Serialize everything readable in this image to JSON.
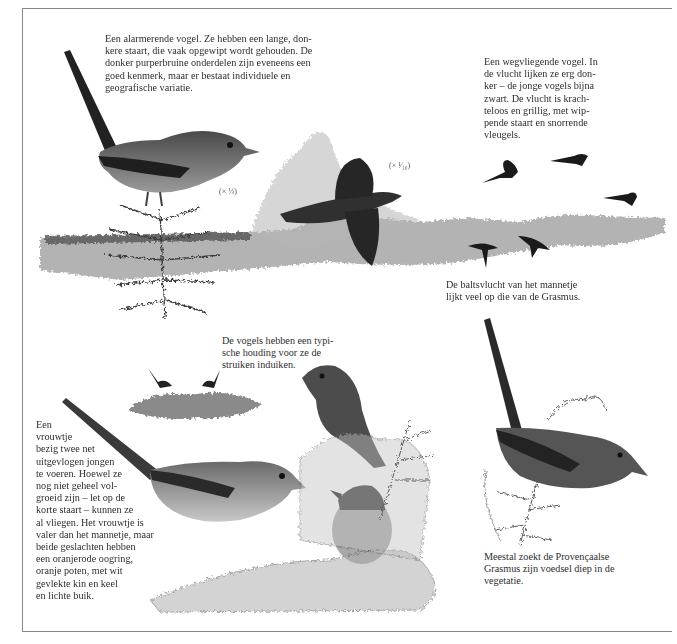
{
  "captions": {
    "alarm": "Een alarmerende vogel. Ze hebben een lange, don-\nkere staart, die vaak opgewipt wordt gehouden. De\ndonker purperbruine onderdelen zijn eveneens een\ngoed kenmerk, maar er bestaat individuele en\ngeografische variatie.",
    "flying": "Een wegvliegende vogel. In\nde vlucht lijken ze erg don-\nker – de jonge vogels bijna\nzwart. De vlucht is krach-\nteloos en grillig, met wip-\npende staart en snorrende\nvleugels.",
    "display_flight": "De baltsvlucht van het mannetje\nlijkt veel op die van de Grasmus.",
    "posture": "De vogels hebben een typi-\nsche houding voor ze de\nstruiken induiken.",
    "female": "Een\nvrouwtje\nbezig twee net\nuitgevlogen jongen\nte voeren. Hoewel ze\nnog niet geheel vol-\ngroeid zijn – let op de\nkorte staart – kunnen ze\nal vliegen. Het vrouwtje is\nvaler dan het mannetje, maar\nbeide geslachten hebben\neen oranjerode oogring,\noranje poten, met wit\ngevlekte kin en keel\nen lichte buik.",
    "foraging": "Meestal zoekt de Provençaalse\nGrasmus zijn voedsel diep in de\nvegetatie."
  },
  "scales": {
    "perched": "(× ⅓)",
    "flight": "(× ¹⁄₁₀)"
  },
  "colors": {
    "ink": "#2e2e2e",
    "bird_dark": "#2a2a2a",
    "bird_mid": "#5a5a5a",
    "vegetation": "#8c8c8c",
    "frame": "#8a8a8a"
  }
}
